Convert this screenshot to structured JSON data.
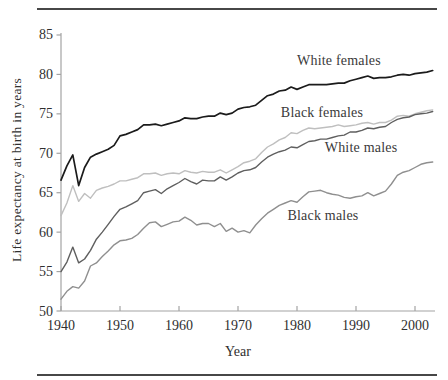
{
  "figure": {
    "y_axis_title": "Life expectancy at birth in years",
    "x_axis_title": "Year"
  },
  "chart_data": {
    "type": "line",
    "title": "",
    "xlabel": "Year",
    "ylabel": "Life expectancy at birth in years",
    "xlim": [
      1940,
      2005
    ],
    "ylim": [
      50,
      85
    ],
    "x_ticks": [
      1940,
      1950,
      1960,
      1970,
      1980,
      1990,
      2000
    ],
    "y_ticks": [
      50,
      55,
      60,
      65,
      70,
      75,
      80,
      85
    ],
    "grid": false,
    "legend_position": "inline-annotations",
    "start_year": 1940,
    "end_year": 2003,
    "axis_color": "#a3a3a3",
    "series": [
      {
        "name": "White females",
        "color": "#1b1b1b",
        "width": 1.7,
        "values": [
          66.6,
          68.4,
          69.8,
          65.9,
          68.2,
          69.5,
          69.9,
          70.2,
          70.5,
          71.0,
          72.2,
          72.4,
          72.7,
          73.0,
          73.6,
          73.6,
          73.7,
          73.5,
          73.7,
          73.9,
          74.1,
          74.5,
          74.4,
          74.4,
          74.6,
          74.7,
          74.7,
          75.1,
          74.9,
          75.1,
          75.6,
          75.8,
          75.9,
          76.1,
          76.7,
          77.3,
          77.5,
          77.9,
          78.0,
          78.4,
          78.1,
          78.4,
          78.7,
          78.7,
          78.7,
          78.7,
          78.8,
          78.9,
          78.9,
          79.2,
          79.4,
          79.6,
          79.8,
          79.5,
          79.6,
          79.6,
          79.7,
          79.9,
          80.0,
          79.9,
          80.1,
          80.2,
          80.3,
          80.5
        ]
      },
      {
        "name": "Black females",
        "color": "#bfbfbf",
        "width": 1.4,
        "values": [
          62.1,
          63.7,
          65.9,
          63.9,
          64.9,
          64.3,
          65.3,
          65.6,
          65.8,
          66.1,
          66.5,
          66.5,
          66.7,
          66.9,
          67.4,
          67.4,
          67.5,
          67.2,
          67.4,
          67.5,
          67.4,
          67.8,
          67.6,
          67.5,
          67.7,
          67.6,
          67.6,
          67.9,
          67.5,
          67.9,
          68.3,
          68.8,
          69.0,
          69.3,
          70.1,
          70.8,
          71.2,
          71.7,
          72.0,
          72.6,
          72.5,
          72.9,
          73.2,
          73.1,
          73.2,
          73.3,
          73.4,
          73.6,
          73.4,
          73.5,
          73.6,
          73.8,
          73.9,
          73.7,
          73.9,
          73.9,
          74.2,
          74.7,
          74.8,
          74.7,
          75.0,
          75.2,
          75.4,
          75.5
        ]
      },
      {
        "name": "White males",
        "color": "#5f5f5f",
        "width": 1.4,
        "values": [
          55.0,
          56.2,
          58.1,
          56.1,
          56.6,
          57.7,
          59.1,
          60.0,
          61.0,
          62.0,
          62.9,
          63.2,
          63.6,
          64.0,
          65.0,
          65.2,
          65.4,
          64.9,
          65.5,
          65.9,
          66.3,
          66.8,
          66.4,
          66.1,
          66.6,
          66.5,
          66.5,
          67.0,
          66.6,
          67.0,
          67.5,
          67.8,
          67.9,
          68.2,
          68.9,
          69.5,
          69.9,
          70.2,
          70.4,
          70.8,
          70.7,
          71.1,
          71.5,
          71.6,
          71.8,
          71.8,
          72.0,
          72.2,
          72.3,
          72.7,
          72.7,
          72.9,
          73.2,
          73.1,
          73.3,
          73.4,
          73.9,
          74.3,
          74.5,
          74.6,
          74.9,
          75.0,
          75.1,
          75.3
        ]
      },
      {
        "name": "Black males",
        "color": "#8f8f8f",
        "width": 1.4,
        "values": [
          51.5,
          52.5,
          53.1,
          52.9,
          53.8,
          55.7,
          56.1,
          56.9,
          57.6,
          58.4,
          58.9,
          59.0,
          59.2,
          59.7,
          60.5,
          61.2,
          61.3,
          60.7,
          61.0,
          61.3,
          61.4,
          61.9,
          61.5,
          60.9,
          61.1,
          61.1,
          60.7,
          61.1,
          60.1,
          60.5,
          60.0,
          60.2,
          59.9,
          60.9,
          61.7,
          62.4,
          62.9,
          63.4,
          63.7,
          64.0,
          63.8,
          64.5,
          65.1,
          65.2,
          65.3,
          65.0,
          64.8,
          64.7,
          64.4,
          64.3,
          64.5,
          64.6,
          65.0,
          64.6,
          64.9,
          65.2,
          66.1,
          67.2,
          67.6,
          67.8,
          68.2,
          68.6,
          68.8,
          68.9
        ]
      }
    ]
  }
}
